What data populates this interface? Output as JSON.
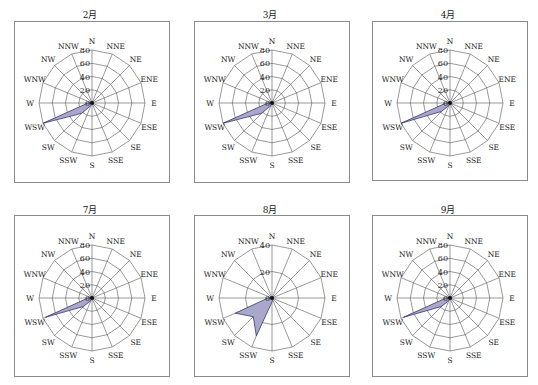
{
  "directions": [
    "N",
    "NNE",
    "NE",
    "ENE",
    "E",
    "ESE",
    "SE",
    "SSE",
    "S",
    "SSW",
    "SW",
    "WSW",
    "W",
    "WNW",
    "NW",
    "NNW"
  ],
  "style": {
    "fill_color": "#a9a8cc",
    "stroke_color": "#3a3a6e",
    "grid_color": "#555555",
    "frame_color": "#8a8a8a"
  },
  "charts": [
    {
      "title": "2月",
      "max": 80,
      "ticks": [
        "0",
        "20",
        "40",
        "60",
        "80"
      ],
      "values": [
        0,
        0,
        0,
        0,
        0,
        0,
        0,
        0,
        2,
        4,
        22,
        80,
        6,
        0,
        0,
        0
      ]
    },
    {
      "title": "3月",
      "max": 80,
      "ticks": [
        "0",
        "20",
        "40",
        "60",
        "80"
      ],
      "values": [
        0,
        0,
        0,
        0,
        0,
        0,
        0,
        0,
        2,
        4,
        22,
        80,
        6,
        0,
        0,
        0
      ]
    },
    {
      "title": "4月",
      "max": 80,
      "ticks": [
        "0",
        "20",
        "40",
        "60",
        "80"
      ],
      "values": [
        0,
        0,
        0,
        0,
        0,
        0,
        0,
        0,
        2,
        4,
        18,
        80,
        6,
        0,
        0,
        0
      ]
    },
    {
      "title": "7月",
      "max": 80,
      "ticks": [
        "0",
        "20",
        "40",
        "60",
        "80"
      ],
      "values": [
        0,
        0,
        0,
        0,
        0,
        0,
        0,
        0,
        2,
        4,
        18,
        76,
        6,
        0,
        0,
        0
      ]
    },
    {
      "title": "8月",
      "max": 40,
      "ticks": [
        "0",
        "20",
        "40"
      ],
      "values": [
        1,
        0,
        0,
        0,
        0,
        1,
        1,
        1,
        3,
        31,
        20,
        30,
        3,
        0,
        0,
        0
      ]
    },
    {
      "title": "9月",
      "max": 80,
      "ticks": [
        "0",
        "20",
        "40",
        "60",
        "80"
      ],
      "values": [
        0,
        0,
        0,
        0,
        0,
        0,
        0,
        0,
        2,
        4,
        18,
        76,
        6,
        0,
        0,
        0
      ]
    }
  ],
  "chart_data": [
    {
      "type": "radar",
      "title": "2月",
      "categories": [
        "N",
        "NNE",
        "NE",
        "ENE",
        "E",
        "ESE",
        "SE",
        "SSE",
        "S",
        "SSW",
        "SW",
        "WSW",
        "W",
        "WNW",
        "NW",
        "NNW"
      ],
      "values": [
        0,
        0,
        0,
        0,
        0,
        0,
        0,
        0,
        2,
        4,
        22,
        80,
        6,
        0,
        0,
        0
      ],
      "ylim": [
        0,
        80
      ],
      "ticks": [
        0,
        20,
        40,
        60,
        80
      ],
      "grid": true
    },
    {
      "type": "radar",
      "title": "3月",
      "categories": [
        "N",
        "NNE",
        "NE",
        "ENE",
        "E",
        "ESE",
        "SE",
        "SSE",
        "S",
        "SSW",
        "SW",
        "WSW",
        "W",
        "WNW",
        "NW",
        "NNW"
      ],
      "values": [
        0,
        0,
        0,
        0,
        0,
        0,
        0,
        0,
        2,
        4,
        22,
        80,
        6,
        0,
        0,
        0
      ],
      "ylim": [
        0,
        80
      ],
      "ticks": [
        0,
        20,
        40,
        60,
        80
      ],
      "grid": true
    },
    {
      "type": "radar",
      "title": "4月",
      "categories": [
        "N",
        "NNE",
        "NE",
        "ENE",
        "E",
        "ESE",
        "SE",
        "SSE",
        "S",
        "SSW",
        "SW",
        "WSW",
        "W",
        "WNW",
        "NW",
        "NNW"
      ],
      "values": [
        0,
        0,
        0,
        0,
        0,
        0,
        0,
        0,
        2,
        4,
        18,
        80,
        6,
        0,
        0,
        0
      ],
      "ylim": [
        0,
        80
      ],
      "ticks": [
        0,
        20,
        40,
        60,
        80
      ],
      "grid": true
    },
    {
      "type": "radar",
      "title": "7月",
      "categories": [
        "N",
        "NNE",
        "NE",
        "ENE",
        "E",
        "ESE",
        "SE",
        "SSE",
        "S",
        "SSW",
        "SW",
        "WSW",
        "W",
        "WNW",
        "NW",
        "NNW"
      ],
      "values": [
        0,
        0,
        0,
        0,
        0,
        0,
        0,
        0,
        2,
        4,
        18,
        76,
        6,
        0,
        0,
        0
      ],
      "ylim": [
        0,
        80
      ],
      "ticks": [
        0,
        20,
        40,
        60,
        80
      ],
      "grid": true
    },
    {
      "type": "radar",
      "title": "8月",
      "categories": [
        "N",
        "NNE",
        "NE",
        "ENE",
        "E",
        "ESE",
        "SE",
        "SSE",
        "S",
        "SSW",
        "SW",
        "WSW",
        "W",
        "WNW",
        "NW",
        "NNW"
      ],
      "values": [
        1,
        0,
        0,
        0,
        0,
        1,
        1,
        1,
        3,
        31,
        20,
        30,
        3,
        0,
        0,
        0
      ],
      "ylim": [
        0,
        40
      ],
      "ticks": [
        0,
        20,
        40
      ],
      "grid": true
    },
    {
      "type": "radar",
      "title": "9月",
      "categories": [
        "N",
        "NNE",
        "NE",
        "ENE",
        "E",
        "ESE",
        "SE",
        "SSE",
        "S",
        "SSW",
        "SW",
        "WSW",
        "W",
        "WNW",
        "NW",
        "NNW"
      ],
      "values": [
        0,
        0,
        0,
        0,
        0,
        0,
        0,
        0,
        2,
        4,
        18,
        76,
        6,
        0,
        0,
        0
      ],
      "ylim": [
        0,
        80
      ],
      "ticks": [
        0,
        20,
        40,
        60,
        80
      ],
      "grid": true
    }
  ]
}
